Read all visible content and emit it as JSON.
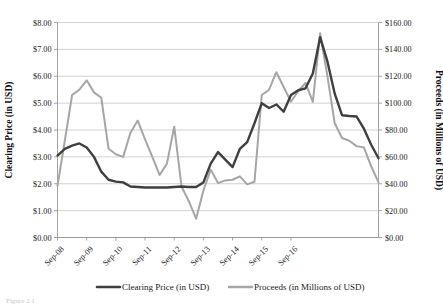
{
  "chart_data": {
    "type": "line",
    "title": "",
    "subtitle": "",
    "xlabel": "",
    "ylabel": "Clearing Price (in USD)",
    "y2label": "Proceeds (in Millions of USD)",
    "grid": true,
    "legend_position": "bottom",
    "ylim": [
      0,
      8
    ],
    "y2lim": [
      0,
      160
    ],
    "ytick_labels": [
      "$0.00",
      "$1.00",
      "$2.00",
      "$3.00",
      "$4.00",
      "$5.00",
      "$6.00",
      "$7.00",
      "$8.00"
    ],
    "ytick_values": [
      0,
      1,
      2,
      3,
      4,
      5,
      6,
      7,
      8
    ],
    "y2tick_labels": [
      "$0.00",
      "$20.00",
      "$40.00",
      "$60.00",
      "$80.00",
      "$100.00",
      "$120.00",
      "$140.00",
      "$160.00"
    ],
    "y2tick_values": [
      0,
      20,
      40,
      60,
      80,
      100,
      120,
      140,
      160
    ],
    "xtick_labels": [
      "Sep-08",
      "Sep-09",
      "Sep-10",
      "Sep-11",
      "Sep-12",
      "Sep-13",
      "Sep-14",
      "Sep-15",
      "Sep-16"
    ],
    "xtick_indices": [
      0,
      4,
      8,
      12,
      16,
      20,
      24,
      28,
      32
    ],
    "x": [
      0,
      1,
      2,
      3,
      4,
      5,
      6,
      7,
      8,
      9,
      10,
      11,
      12,
      13,
      14,
      15,
      16,
      17,
      18,
      19,
      20,
      21,
      22,
      23,
      24,
      25,
      26,
      27,
      28,
      29,
      30,
      31,
      32,
      33,
      34,
      35
    ],
    "series": [
      {
        "name": "Clearing Price (in USD)",
        "axis": "left",
        "color": "#3f3f3f",
        "width": 2.4,
        "values": [
          3.05,
          3.3,
          3.42,
          3.5,
          3.35,
          3.0,
          2.45,
          2.15,
          2.08,
          2.05,
          1.9,
          1.88,
          1.86,
          1.86,
          1.86,
          1.86,
          1.88,
          1.9,
          1.88,
          1.88,
          2.05,
          2.75,
          3.18,
          2.9,
          2.62,
          3.3,
          3.55,
          4.25,
          5.0,
          4.82,
          4.95,
          4.68,
          5.3,
          5.48,
          5.55,
          6.1
        ]
      },
      {
        "name": "Proceeds (in Millions of USD)",
        "axis": "right",
        "color": "#a6a6a6",
        "width": 2.0,
        "values": [
          38.5,
          72.0,
          106.0,
          110.0,
          117.0,
          108.0,
          104.0,
          66.0,
          62.0,
          60.0,
          78.0,
          87.0,
          73.0,
          60.0,
          46.5,
          55.0,
          82.5,
          38.0,
          27.0,
          14.0,
          35.0,
          50.5,
          40.5,
          42.5,
          43.0,
          45.5,
          39.5,
          41.5,
          106.0,
          110.0,
          123.0,
          112.0,
          101.0,
          109.0,
          115.0,
          101.0
        ]
      }
    ],
    "series_tail": {
      "note": "continuation of both series through Sep-16",
      "x": [
        36,
        37,
        38,
        39,
        40,
        41,
        42,
        43,
        44
      ],
      "clearing_price": [
        7.45,
        6.55,
        5.35,
        4.55,
        4.52,
        4.5,
        4.05,
        3.45,
        2.95
      ],
      "proceeds": [
        152.0,
        120.0,
        85.0,
        74.0,
        72.0,
        68.0,
        67.0,
        53.0,
        41.0
      ]
    },
    "annotations": [],
    "legend": [
      {
        "label": "Clearing Price (in USD)",
        "color": "#3f3f3f"
      },
      {
        "label": "Proceeds (in Millions of USD)",
        "color": "#a6a6a6"
      }
    ]
  },
  "axes": {
    "left_title": "Clearing Price (in USD)",
    "right_title": "Proceeds (in Millions of USD)"
  },
  "legend": {
    "items": [
      {
        "label": "Clearing Price (in USD)"
      },
      {
        "label": "Proceeds (in Millions of USD)"
      }
    ]
  },
  "caption": {
    "text": "Figure 2.1"
  }
}
